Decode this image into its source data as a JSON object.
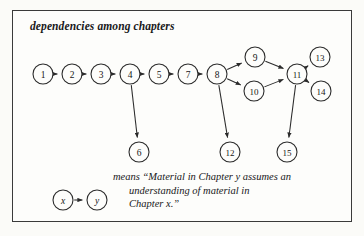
{
  "figure": {
    "title": "dependencies among chapters",
    "frame_color": "#3a3a3a",
    "background_color": "#fdfdfb",
    "ink_color": "#2b2b2b"
  },
  "caption": {
    "line1": "means “Material in Chapter y assumes an",
    "line2": "understanding of material in",
    "line3": "Chapter x.”"
  },
  "legend": {
    "from_label": "x",
    "to_label": "y"
  },
  "chart_data": {
    "type": "diagram",
    "title": "dependencies among chapters",
    "graph_type": "directed-acyclic-graph",
    "nodes": [
      {
        "id": "1",
        "label": "1",
        "x": 43,
        "y": 74,
        "r": 10
      },
      {
        "id": "2",
        "label": "2",
        "x": 72,
        "y": 74,
        "r": 10
      },
      {
        "id": "3",
        "label": "3",
        "x": 101,
        "y": 74,
        "r": 10
      },
      {
        "id": "4",
        "label": "4",
        "x": 130,
        "y": 74,
        "r": 10
      },
      {
        "id": "5",
        "label": "5",
        "x": 159,
        "y": 74,
        "r": 10
      },
      {
        "id": "7",
        "label": "7",
        "x": 188,
        "y": 74,
        "r": 10
      },
      {
        "id": "8",
        "label": "8",
        "x": 217,
        "y": 74,
        "r": 10
      },
      {
        "id": "9",
        "label": "9",
        "x": 255,
        "y": 57,
        "r": 10
      },
      {
        "id": "10",
        "label": "10",
        "x": 254,
        "y": 91,
        "r": 10
      },
      {
        "id": "11",
        "label": "11",
        "x": 297,
        "y": 74,
        "r": 10
      },
      {
        "id": "13",
        "label": "13",
        "x": 320,
        "y": 57,
        "r": 10
      },
      {
        "id": "14",
        "label": "14",
        "x": 321,
        "y": 91,
        "r": 10
      },
      {
        "id": "6",
        "label": "6",
        "x": 139,
        "y": 152,
        "r": 10
      },
      {
        "id": "12",
        "label": "12",
        "x": 230,
        "y": 152,
        "r": 10
      },
      {
        "id": "15",
        "label": "15",
        "x": 287,
        "y": 152,
        "r": 10
      }
    ],
    "edges": [
      {
        "from": "1",
        "to": "2"
      },
      {
        "from": "2",
        "to": "3"
      },
      {
        "from": "3",
        "to": "4"
      },
      {
        "from": "4",
        "to": "5"
      },
      {
        "from": "5",
        "to": "7"
      },
      {
        "from": "7",
        "to": "8"
      },
      {
        "from": "8",
        "to": "9"
      },
      {
        "from": "8",
        "to": "10"
      },
      {
        "from": "9",
        "to": "11"
      },
      {
        "from": "10",
        "to": "11"
      },
      {
        "from": "11",
        "to": "13"
      },
      {
        "from": "11",
        "to": "14"
      },
      {
        "from": "4",
        "to": "6"
      },
      {
        "from": "8",
        "to": "12"
      },
      {
        "from": "11",
        "to": "15"
      }
    ],
    "legend_edge": {
      "from": "x",
      "to": "y"
    }
  }
}
